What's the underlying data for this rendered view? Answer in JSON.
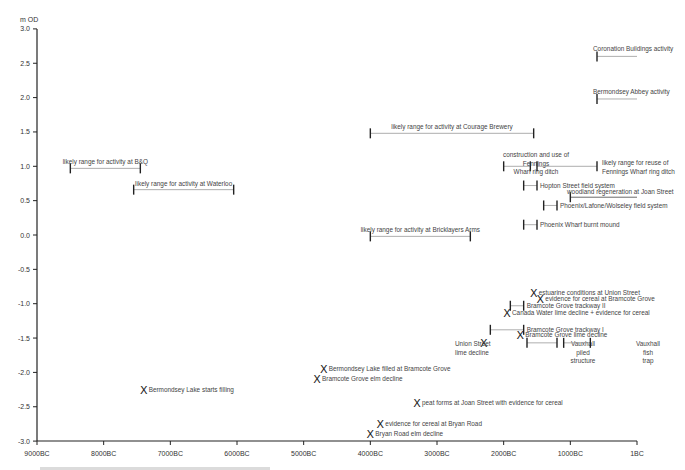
{
  "chart_data": {
    "type": "scatter",
    "title": "",
    "ylabel": "m OD",
    "xlabel": "",
    "ylim": [
      -3.0,
      3.0
    ],
    "xlim_labels": [
      "9000BC",
      "1BC"
    ],
    "grid": false,
    "y_ticks": [
      "3.0",
      "2.5",
      "2.0",
      "1.5",
      "1.0",
      "0.5",
      "0.0",
      "-0.5",
      "-1.0",
      "-1.5",
      "-2.0",
      "-2.5",
      "-3.0"
    ],
    "x_ticks": [
      "9000BC",
      "8000BC",
      "7000BC",
      "6000BC",
      "5000BC",
      "4000BC",
      "3000BC",
      "2000BC",
      "1000BC",
      "1BC"
    ],
    "ranges": [
      {
        "label": "Coronation Buildings activity",
        "from": -600,
        "to": 0,
        "y": 2.6
      },
      {
        "label": "Bermondsey Abbey activity",
        "from": -600,
        "to": 0,
        "y": 1.98
      },
      {
        "label": "likely range for activity at Courage Brewery",
        "from": -4000,
        "to": -1550,
        "y": 1.48
      },
      {
        "label": "likely range for activity at B&Q",
        "from": -8500,
        "to": -7450,
        "y": 0.97
      },
      {
        "label": "likely range for activity at Waterloo",
        "from": -7550,
        "to": -6050,
        "y": 0.66
      },
      {
        "label": "construction and use of Fennings Wharf ring ditch",
        "from": -2000,
        "to": -1600,
        "y": 1.0
      },
      {
        "label": "likely range for reuse of Fennings Wharf ring ditch",
        "from": -1500,
        "to": -600,
        "y": 1.0
      },
      {
        "label": "Hopton Street field system",
        "from": -1700,
        "to": -1500,
        "y": 0.72
      },
      {
        "label": "woodland regeneration at Joan Street",
        "from": -1000,
        "to": 0,
        "y": 0.55
      },
      {
        "label": "Phoenix/Lafone/Wolseley field system",
        "from": -1400,
        "to": -1200,
        "y": 0.43
      },
      {
        "label": "Phoenix Wharf burnt mound",
        "from": -1700,
        "to": -1500,
        "y": 0.15
      },
      {
        "label": "likely range for activity at Bricklayers Arms",
        "from": -4000,
        "to": -2500,
        "y": -0.02
      },
      {
        "label": "Bramcote Grove trackway II",
        "from": -1900,
        "to": -1700,
        "y": -1.03
      },
      {
        "label": "Bramcote Grove trackway I",
        "from": -2200,
        "to": -1700,
        "y": -1.38
      },
      {
        "label": "Vauxhall piled structure",
        "from": -1650,
        "to": -1200,
        "y": -1.57
      },
      {
        "label": "Vauxhall fish trap",
        "from": -1100,
        "to": -700,
        "y": -1.57
      }
    ],
    "points": [
      {
        "label": "estuarine conditions at Union Street",
        "x": -1550,
        "y": -0.85
      },
      {
        "label": "evidence for cereal at Bramcote Grove",
        "x": -1450,
        "y": -0.93
      },
      {
        "label": "Canada Water lime decline + evidence for cereal",
        "x": -1950,
        "y": -1.13
      },
      {
        "label": "Bramcote Grove lime decline",
        "x": -1750,
        "y": -1.45
      },
      {
        "label": "Union Street lime decline",
        "x": -2300,
        "y": -1.57
      },
      {
        "label": "Bermondsey Lake filled at Bramcote Grove",
        "x": -4700,
        "y": -1.95
      },
      {
        "label": "Bramcote Grove elm decline",
        "x": -4800,
        "y": -2.1
      },
      {
        "label": "Bermondsey Lake starts filling",
        "x": -7400,
        "y": -2.25
      },
      {
        "label": "peat forms at Joan Street with evidence for cereal",
        "x": -3300,
        "y": -2.45
      },
      {
        "label": "evidence for cereal at Bryan Road",
        "x": -3850,
        "y": -2.75
      },
      {
        "label": "Bryan Road elm decline",
        "x": -4000,
        "y": -2.9
      }
    ]
  },
  "axis": {
    "y_unit": "m OD"
  }
}
